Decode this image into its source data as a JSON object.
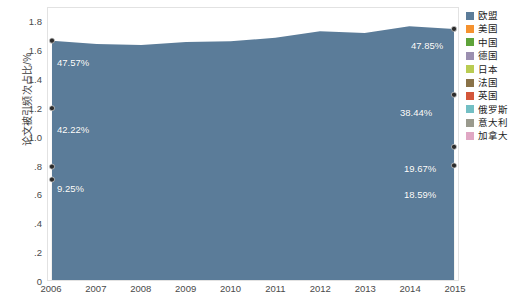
{
  "axes": {
    "y_title": "论文被引频次占比/%",
    "y_ticks": [
      "1.8",
      "1.6",
      "1.4",
      "1.2",
      "1.0",
      ".8",
      ".6",
      ".4",
      ".2",
      "0"
    ],
    "x_ticks": [
      "2006",
      "2007",
      "2008",
      "2009",
      "2010",
      "2011",
      "2012",
      "2013",
      "2014",
      "2015"
    ]
  },
  "legend": {
    "items": [
      {
        "label": "欧盟",
        "color": "#5b7c99"
      },
      {
        "label": "美国",
        "color": "#f5922f"
      },
      {
        "label": "中国",
        "color": "#5ea33a"
      },
      {
        "label": "德国",
        "color": "#9b8fb0"
      },
      {
        "label": "日本",
        "color": "#b9cc52"
      },
      {
        "label": "法国",
        "color": "#8a7248"
      },
      {
        "label": "英国",
        "color": "#d4563a"
      },
      {
        "label": "俄罗斯",
        "color": "#73bfc4"
      },
      {
        "label": "意大利",
        "color": "#9a9a8e"
      },
      {
        "label": "加拿大",
        "color": "#e0a7c4"
      }
    ]
  },
  "data_labels": [
    {
      "text": "47.57%",
      "x": 57,
      "y": 57
    },
    {
      "text": "42.22%",
      "x": 57,
      "y": 124
    },
    {
      "text": "9.25%",
      "x": 57,
      "y": 183
    },
    {
      "text": "47.85%",
      "x": 411,
      "y": 40
    },
    {
      "text": "38.44%",
      "x": 400,
      "y": 107
    },
    {
      "text": "19.67%",
      "x": 404,
      "y": 163
    },
    {
      "text": "18.59%",
      "x": 404,
      "y": 189
    }
  ],
  "chart_data": {
    "type": "area",
    "stacked": true,
    "title": "",
    "xlabel": "",
    "ylabel": "论文被引频次占比/%",
    "ylim": [
      0,
      1.9
    ],
    "y_tick_values": [
      0,
      0.2,
      0.4,
      0.6,
      0.8,
      1.0,
      1.2,
      1.4,
      1.6,
      1.8
    ],
    "grid": false,
    "legend_position": "right",
    "x": [
      "2006",
      "2007",
      "2008",
      "2009",
      "2010",
      "2011",
      "2012",
      "2013",
      "2014",
      "2015"
    ],
    "annotations": [
      {
        "series": "欧盟",
        "year": "2006",
        "value": "47.57%"
      },
      {
        "series": "美国",
        "year": "2006",
        "value": "42.22%"
      },
      {
        "series": "中国",
        "year": "2006",
        "value": "9.25%"
      },
      {
        "series": "欧盟",
        "year": "2015",
        "value": "47.85%"
      },
      {
        "series": "美国",
        "year": "2015",
        "value": "38.44%"
      },
      {
        "series": "中国",
        "year": "2015",
        "value": "19.67%"
      },
      {
        "series": "德国",
        "year": "2015",
        "value": "18.59%"
      }
    ],
    "note": "Values are cumulative stack tops read off the y axis (units of the y axis, /%)",
    "series": [
      {
        "name": "欧盟",
        "color": "#5b7c99",
        "cum_top": [
          1.672,
          1.648,
          1.642,
          1.662,
          1.668,
          1.692,
          1.738,
          1.726,
          1.772,
          1.754
        ]
      },
      {
        "name": "美国",
        "color": "#f5922f",
        "cum_top": [
          1.2,
          1.188,
          1.182,
          1.196,
          1.212,
          1.238,
          1.29,
          1.262,
          1.308,
          1.294
        ]
      },
      {
        "name": "中国",
        "color": "#5ea33a",
        "cum_top": [
          0.792,
          0.788,
          0.796,
          0.812,
          0.826,
          0.852,
          0.884,
          0.874,
          0.91,
          0.93
        ]
      },
      {
        "name": "德国",
        "color": "#9b8fb0",
        "cum_top": [
          0.702,
          0.7,
          0.706,
          0.716,
          0.73,
          0.748,
          0.766,
          0.758,
          0.792,
          0.8
        ]
      },
      {
        "name": "日本",
        "color": "#b9cc52",
        "cum_top": [
          0.57,
          0.566,
          0.568,
          0.574,
          0.58,
          0.59,
          0.6,
          0.594,
          0.614,
          0.62
        ]
      },
      {
        "name": "法国",
        "color": "#8a7248",
        "cum_top": [
          0.472,
          0.47,
          0.472,
          0.476,
          0.482,
          0.49,
          0.498,
          0.494,
          0.51,
          0.516
        ]
      },
      {
        "name": "英国",
        "color": "#d4563a",
        "cum_top": [
          0.382,
          0.38,
          0.382,
          0.386,
          0.39,
          0.396,
          0.402,
          0.4,
          0.412,
          0.418
        ]
      },
      {
        "name": "俄罗斯",
        "color": "#73bfc4",
        "cum_top": [
          0.272,
          0.27,
          0.27,
          0.272,
          0.274,
          0.278,
          0.282,
          0.28,
          0.288,
          0.292
        ]
      },
      {
        "name": "意大利",
        "color": "#9a9a8e",
        "cum_top": [
          0.186,
          0.186,
          0.188,
          0.19,
          0.192,
          0.196,
          0.2,
          0.198,
          0.206,
          0.21
        ]
      },
      {
        "name": "加拿大",
        "color": "#e0a7c4",
        "cum_top": [
          0.096,
          0.096,
          0.096,
          0.098,
          0.098,
          0.1,
          0.102,
          0.102,
          0.106,
          0.108
        ]
      }
    ],
    "markers": {
      "color": "#2b2b2b",
      "points": [
        {
          "year": "2006",
          "cum_top": 1.672
        },
        {
          "year": "2006",
          "cum_top": 1.2
        },
        {
          "year": "2006",
          "cum_top": 0.792
        },
        {
          "year": "2006",
          "cum_top": 0.702
        },
        {
          "year": "2015",
          "cum_top": 1.754
        },
        {
          "year": "2015",
          "cum_top": 1.294
        },
        {
          "year": "2015",
          "cum_top": 0.93
        },
        {
          "year": "2015",
          "cum_top": 0.8
        }
      ]
    }
  }
}
